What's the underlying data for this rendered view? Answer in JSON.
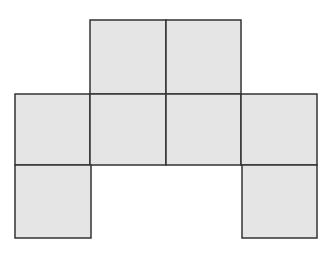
{
  "diagram": {
    "fill_color": "#e5e5e5",
    "stroke_color": "#333333",
    "squares": [
      {
        "row": 0,
        "col": 1,
        "x": 90,
        "y": 20,
        "w": 76,
        "h": 74
      },
      {
        "row": 0,
        "col": 2,
        "x": 166,
        "y": 20,
        "w": 75,
        "h": 74
      },
      {
        "row": 1,
        "col": 0,
        "x": 15,
        "y": 94,
        "w": 75,
        "h": 71
      },
      {
        "row": 1,
        "col": 1,
        "x": 90,
        "y": 94,
        "w": 76,
        "h": 71
      },
      {
        "row": 1,
        "col": 2,
        "x": 166,
        "y": 94,
        "w": 75,
        "h": 71
      },
      {
        "row": 1,
        "col": 3,
        "x": 241,
        "y": 94,
        "w": 76,
        "h": 71
      },
      {
        "row": 2,
        "col": 0,
        "x": 15,
        "y": 165,
        "w": 76,
        "h": 73
      },
      {
        "row": 2,
        "col": 3,
        "x": 242,
        "y": 165,
        "w": 75,
        "h": 73
      }
    ]
  }
}
